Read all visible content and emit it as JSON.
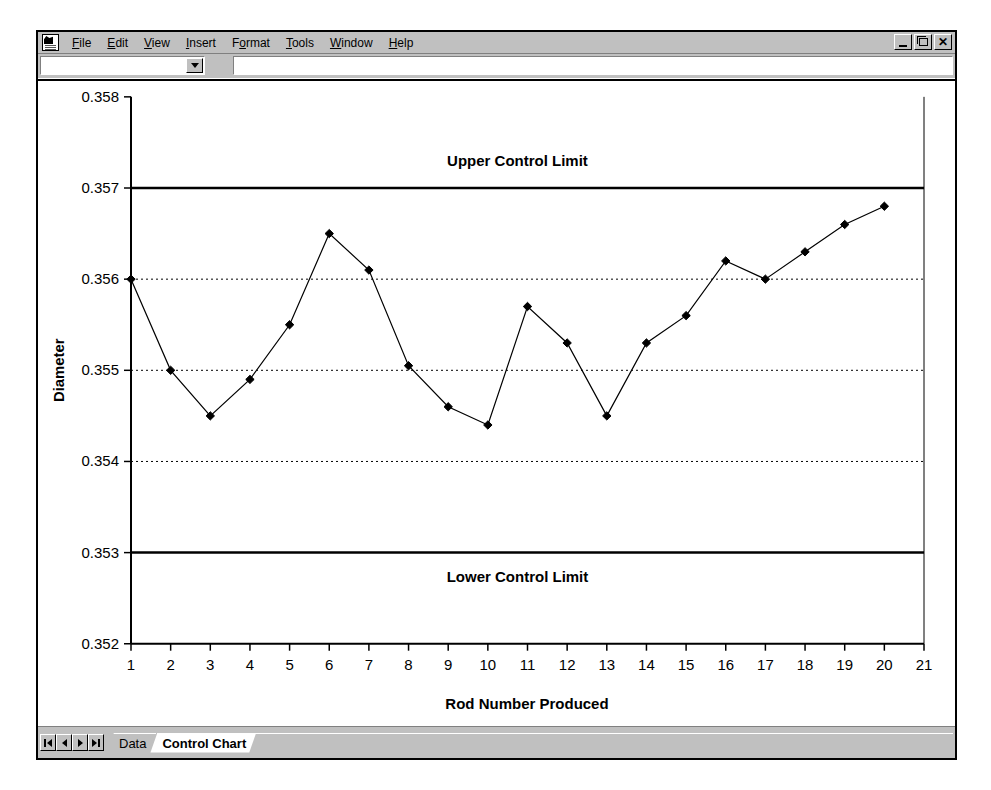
{
  "window": {
    "app_icon": "spreadsheet-document-icon",
    "menus": [
      {
        "label": "File",
        "mnemonic": "F"
      },
      {
        "label": "Edit",
        "mnemonic": "E"
      },
      {
        "label": "View",
        "mnemonic": "V"
      },
      {
        "label": "Insert",
        "mnemonic": "I"
      },
      {
        "label": "Format",
        "mnemonic": "o"
      },
      {
        "label": "Tools",
        "mnemonic": "T"
      },
      {
        "label": "Window",
        "mnemonic": "W"
      },
      {
        "label": "Help",
        "mnemonic": "H"
      }
    ],
    "controls": {
      "minimize": "minimize-icon",
      "restore": "restore-icon",
      "close": "close-icon"
    }
  },
  "formula_bar": {
    "name_box_value": "",
    "name_box_placeholder": "",
    "formula_value": "",
    "formula_placeholder": ""
  },
  "tabbar": {
    "nav": [
      "first-sheet",
      "previous-sheet",
      "next-sheet",
      "last-sheet"
    ],
    "sheets": [
      {
        "label": "Data",
        "active": false
      },
      {
        "label": "Control Chart",
        "active": true
      }
    ]
  },
  "chart_data": {
    "type": "line",
    "title": "",
    "xlabel": "Rod Number Produced",
    "ylabel": "Diameter",
    "xlim": [
      1,
      21
    ],
    "ylim": [
      0.352,
      0.358
    ],
    "xticks": [
      1,
      2,
      3,
      4,
      5,
      6,
      7,
      8,
      9,
      10,
      11,
      12,
      13,
      14,
      15,
      16,
      17,
      18,
      19,
      20,
      21
    ],
    "yticks": [
      0.352,
      0.353,
      0.354,
      0.355,
      0.356,
      0.357,
      0.358
    ],
    "ytick_labels": [
      "0.352",
      "0.353",
      "0.354",
      "0.355",
      "0.356",
      "0.357",
      "0.358"
    ],
    "grid": true,
    "grid_style": "dotted-horizontal",
    "legend": null,
    "marker": "diamond",
    "line_color": "#000000",
    "marker_color": "#000000",
    "x": [
      1,
      2,
      3,
      4,
      5,
      6,
      7,
      8,
      9,
      10,
      11,
      12,
      13,
      14,
      15,
      16,
      17,
      18,
      19,
      20
    ],
    "values": [
      0.356,
      0.355,
      0.3545,
      0.3549,
      0.3555,
      0.3565,
      0.3561,
      0.35505,
      0.3546,
      0.3544,
      0.3557,
      0.3553,
      0.3545,
      0.3553,
      0.3556,
      0.3562,
      0.356,
      0.3563,
      0.3566,
      0.3568
    ],
    "annotations": [
      {
        "name": "upper-control-limit",
        "label": "Upper Control Limit",
        "y": 0.357,
        "line": "solid",
        "color": "#000000"
      },
      {
        "name": "lower-control-limit",
        "label": "Lower Control Limit",
        "y": 0.353,
        "line": "solid",
        "color": "#000000"
      }
    ]
  }
}
